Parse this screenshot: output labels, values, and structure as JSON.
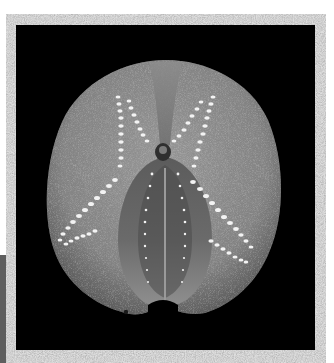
{
  "image": {
    "description": "Photograph of a heart urchin (spatangoid sea urchin) test, aboral view, on black background inside a speckled gray-white frame",
    "subject": "heart urchin test",
    "colors": {
      "page_bg": "#ffffff",
      "frame": "#dcdcdc",
      "frame_speckle_dark": "#b9b9b9",
      "frame_speckle_light": "#f2f2f2",
      "panel_bg": "#000000",
      "test_body": "#8a8a8a",
      "test_body_light": "#a9a9a9",
      "test_shadow": "#4a4a4a",
      "petal_pores": "#f4f4f4",
      "groove_dark": "#3a3a3a",
      "left_edge_strip": "#6a6a6a"
    },
    "layout": {
      "frame": {
        "x": 6,
        "y": 14,
        "w": 320,
        "h": 349
      },
      "panel": {
        "x": 16,
        "y": 25,
        "w": 299,
        "h": 325
      }
    }
  }
}
